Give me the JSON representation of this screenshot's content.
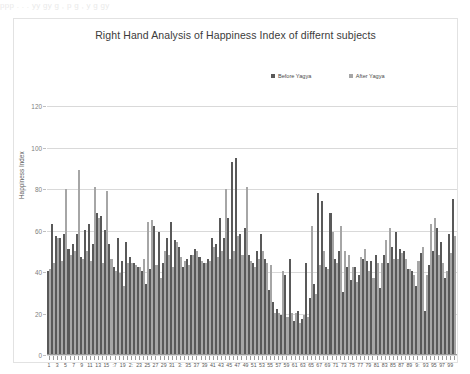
{
  "page": {
    "top_bleed_text": "ppp  .  .  .  yy  gy   g  ,  p g  ,  y  g   gy"
  },
  "chart_data": {
    "type": "bar",
    "title": "Right Hand Analysis of Happiness Index of differnt subjects",
    "xlabel": "Subject",
    "ylabel": "Happiness Index",
    "ylim": [
      0,
      120
    ],
    "yticks": [
      0,
      20,
      40,
      60,
      80,
      100,
      120
    ],
    "grid": true,
    "legend_position": "top-right",
    "colors": {
      "before": "#595959",
      "after": "#a6a6a6",
      "gridline": "#d9d9d9",
      "axis": "#9a9a9a",
      "frame": "#e2e2e2",
      "title_text": "#3b3b3b"
    },
    "x": [
      1,
      2,
      3,
      4,
      5,
      6,
      7,
      8,
      9,
      10,
      11,
      12,
      13,
      14,
      15,
      16,
      17,
      18,
      19,
      20,
      21,
      22,
      23,
      24,
      25,
      26,
      27,
      28,
      29,
      30,
      31,
      32,
      33,
      34,
      35,
      36,
      37,
      38,
      39,
      40,
      41,
      42,
      43,
      44,
      45,
      46,
      47,
      48,
      49,
      50,
      51,
      52,
      53,
      54,
      55,
      56,
      57,
      58,
      59,
      60,
      61,
      62,
      63,
      64,
      65,
      66,
      67,
      68,
      69,
      70,
      71,
      72,
      73,
      74,
      75,
      76,
      77,
      78,
      79,
      80,
      81,
      82,
      83,
      84,
      85,
      86,
      87,
      88,
      89,
      90,
      91,
      92,
      93,
      94,
      95,
      96,
      97,
      98,
      99,
      100
    ],
    "xtick_labels": [
      "1",
      "",
      "3",
      "",
      "5",
      "",
      "7",
      "",
      "9",
      "",
      "11",
      "",
      "13",
      "",
      "15",
      "",
      ":7",
      "",
      "19",
      "",
      "2:",
      "",
      "23",
      "",
      "25",
      "",
      "27",
      "",
      "29",
      "",
      "31",
      "",
      "3:",
      "",
      "35",
      "",
      "37",
      "",
      "39",
      "",
      "41",
      "",
      "43",
      "",
      "45",
      "",
      "47",
      "",
      "49",
      "",
      "51",
      "",
      "53",
      "",
      "55",
      "",
      "57",
      "",
      "59",
      "",
      "61",
      "",
      "63",
      "",
      "65",
      "",
      "67",
      "",
      "69",
      "",
      "71",
      "",
      "73",
      "",
      "75",
      "",
      "77",
      "",
      "79",
      "",
      "81",
      "",
      "83",
      "",
      "85",
      "",
      "87",
      "",
      "89",
      "",
      "9:",
      "",
      "93",
      "",
      "95",
      "",
      "97",
      "",
      "99",
      ""
    ],
    "series": [
      {
        "name": "Before Yagya",
        "color": "#595959",
        "values": [
          40,
          63,
          57,
          56,
          58,
          51,
          53,
          58,
          47,
          60,
          63,
          53,
          68,
          67,
          60,
          53,
          42,
          56,
          45,
          54,
          47,
          44,
          42,
          40,
          34,
          41,
          62,
          59,
          44,
          56,
          64,
          55,
          52,
          42,
          46,
          48,
          51,
          47,
          44,
          46,
          56,
          53,
          66,
          56,
          66,
          93,
          95,
          58,
          61,
          48,
          44,
          50,
          58,
          46,
          31,
          25,
          22,
          19,
          38,
          46,
          16,
          21,
          17,
          44,
          27,
          34,
          78,
          74,
          42,
          68,
          46,
          50,
          30,
          42,
          36,
          42,
          38,
          46,
          45,
          45,
          48,
          32,
          48,
          44,
          52,
          59,
          51,
          50,
          41,
          40,
          33,
          49,
          21,
          43,
          50,
          61,
          54,
          37,
          58,
          75
        ]
      },
      {
        "name": "After Yagya",
        "color": "#a6a6a6",
        "values": [
          41,
          44,
          56,
          45,
          80,
          48,
          50,
          89,
          46,
          50,
          45,
          81,
          66,
          44,
          79,
          46,
          40,
          39,
          33,
          44,
          44,
          43,
          42,
          46,
          64,
          65,
          43,
          37,
          50,
          48,
          42,
          54,
          47,
          45,
          43,
          48,
          50,
          45,
          44,
          45,
          52,
          47,
          50,
          80,
          46,
          50,
          57,
          48,
          81,
          45,
          42,
          46,
          50,
          44,
          43,
          20,
          20,
          40,
          18,
          20,
          20,
          15,
          19,
          18,
          62,
          29,
          43,
          50,
          41,
          59,
          44,
          62,
          50,
          48,
          42,
          35,
          47,
          51,
          40,
          37,
          44,
          44,
          55,
          61,
          46,
          46,
          49,
          46,
          41,
          38,
          45,
          52,
          38,
          63,
          66,
          48,
          44,
          40,
          49,
          57
        ]
      }
    ]
  }
}
